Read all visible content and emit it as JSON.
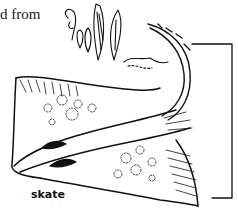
{
  "fragment_text": "d from",
  "illustration": {
    "subject": "skate-fish-line-drawing",
    "caption": "skate",
    "stroke_color": "#111111",
    "background": "#ffffff"
  }
}
